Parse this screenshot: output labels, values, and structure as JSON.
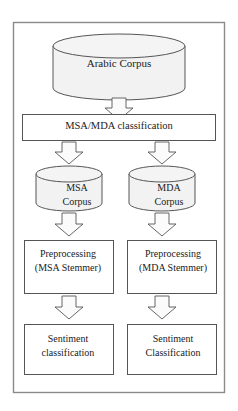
{
  "diagram": {
    "type": "flowchart",
    "colors": {
      "outer_frame_stroke": "#8a8a8a",
      "node_stroke": "#4a4a4a",
      "cylinder_fill": "#f2f2f2",
      "box_fill": "#ffffff",
      "arrow_fill": "#fbfbfb",
      "arrow_stroke": "#555555",
      "text": "#1b1b1b",
      "page_background": "#ffffff"
    },
    "nodes": {
      "arabic_corpus": {
        "label": "Arabic Corpus",
        "shape": "cylinder"
      },
      "classification": {
        "label": "MSA/MDA classification",
        "shape": "rectangle"
      },
      "msa_corpus": {
        "line1": "MSA",
        "line2": "Corpus",
        "shape": "cylinder"
      },
      "mda_corpus": {
        "line1": "MDA",
        "line2": "Corpus",
        "shape": "cylinder"
      },
      "msa_preprocessing": {
        "line1": "Preprocessing",
        "line2": "(MSA Stemmer)",
        "shape": "rectangle"
      },
      "mda_preprocessing": {
        "line1": "Preprocessing",
        "line2": "(MDA Stemmer)",
        "shape": "rectangle"
      },
      "msa_sentiment": {
        "line1": "Sentiment",
        "line2": "classification",
        "shape": "rectangle"
      },
      "mda_sentiment": {
        "line1": "Sentiment",
        "line2": "Classification",
        "shape": "rectangle"
      }
    },
    "edges": [
      {
        "from": "arabic_corpus",
        "to": "classification",
        "style": "block-arrow-down"
      },
      {
        "from": "classification",
        "to": "msa_corpus",
        "style": "block-arrow-down"
      },
      {
        "from": "classification",
        "to": "mda_corpus",
        "style": "block-arrow-down"
      },
      {
        "from": "msa_corpus",
        "to": "msa_preprocessing",
        "style": "block-arrow-down"
      },
      {
        "from": "mda_corpus",
        "to": "mda_preprocessing",
        "style": "block-arrow-down"
      },
      {
        "from": "msa_preprocessing",
        "to": "msa_sentiment",
        "style": "block-arrow-down"
      },
      {
        "from": "mda_preprocessing",
        "to": "mda_sentiment",
        "style": "block-arrow-down"
      }
    ]
  }
}
